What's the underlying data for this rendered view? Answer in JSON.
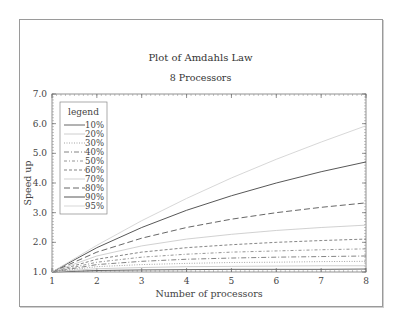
{
  "chart_data": {
    "type": "line",
    "title": "Plot of Amdahls Law",
    "subtitle": "8 Processors",
    "xlabel": "Number of processors",
    "ylabel": "Speed up",
    "xlim": [
      1,
      8
    ],
    "ylim": [
      1.0,
      7.0
    ],
    "x_ticks": [
      "1",
      "2",
      "3",
      "4",
      "5",
      "6",
      "7",
      "8"
    ],
    "y_ticks": [
      "1.0",
      "2.0",
      "3.0",
      "4.0",
      "5.0",
      "6.0",
      "7.0"
    ],
    "grid": false,
    "legend_title": "legend",
    "legend_position": "upper-left",
    "x": [
      1,
      2,
      3,
      4,
      5,
      6,
      7,
      8
    ],
    "series": [
      {
        "name": "10%",
        "values": [
          1.0,
          1.05,
          1.07,
          1.08,
          1.09,
          1.09,
          1.09,
          1.1
        ]
      },
      {
        "name": "20%",
        "values": [
          1.0,
          1.11,
          1.15,
          1.18,
          1.19,
          1.2,
          1.21,
          1.21
        ]
      },
      {
        "name": "30%",
        "values": [
          1.0,
          1.18,
          1.25,
          1.29,
          1.32,
          1.33,
          1.35,
          1.36
        ]
      },
      {
        "name": "40%",
        "values": [
          1.0,
          1.25,
          1.36,
          1.43,
          1.47,
          1.5,
          1.52,
          1.54
        ]
      },
      {
        "name": "50%",
        "values": [
          1.0,
          1.33,
          1.5,
          1.6,
          1.67,
          1.71,
          1.75,
          1.78
        ]
      },
      {
        "name": "60%",
        "values": [
          1.0,
          1.43,
          1.67,
          1.82,
          1.92,
          2.0,
          2.06,
          2.11
        ]
      },
      {
        "name": "70%",
        "values": [
          1.0,
          1.54,
          1.88,
          2.11,
          2.27,
          2.4,
          2.5,
          2.58
        ]
      },
      {
        "name": "80%",
        "values": [
          1.0,
          1.67,
          2.14,
          2.5,
          2.78,
          3.0,
          3.18,
          3.33
        ]
      },
      {
        "name": "90%",
        "values": [
          1.0,
          1.82,
          2.5,
          3.08,
          3.57,
          4.0,
          4.38,
          4.71
        ]
      },
      {
        "name": "95%",
        "values": [
          1.0,
          1.9,
          2.73,
          3.48,
          4.17,
          4.8,
          5.38,
          5.93
        ]
      }
    ]
  },
  "styles": [
    {
      "color": "#555555",
      "dash": ""
    },
    {
      "color": "#c8c8c8",
      "dash": ""
    },
    {
      "color": "#9a9a9a",
      "dash": "1,1.5"
    },
    {
      "color": "#777777",
      "dash": "5,2,1,2"
    },
    {
      "color": "#888888",
      "dash": "3,2,1,2"
    },
    {
      "color": "#777777",
      "dash": "3,2"
    },
    {
      "color": "#cccccc",
      "dash": ""
    },
    {
      "color": "#555555",
      "dash": "6,3"
    },
    {
      "color": "#444444",
      "dash": ""
    },
    {
      "color": "#d2d2d2",
      "dash": ""
    }
  ]
}
